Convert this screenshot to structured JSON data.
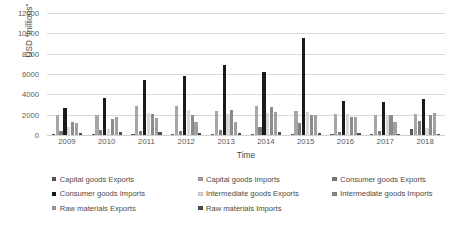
{
  "chart_data": {
    "type": "bar",
    "title": "",
    "xlabel": "Time",
    "ylabel": "USD \"millions\"",
    "categories": [
      "2009",
      "2010",
      "2011",
      "2012",
      "2013",
      "2014",
      "2015",
      "2016",
      "2017",
      "2018"
    ],
    "ylim": [
      0,
      12000
    ],
    "yticks": [
      0,
      2000,
      4000,
      6000,
      8000,
      10000,
      12000
    ],
    "ytick_labels": [
      "0",
      "2000",
      "4000",
      "6000",
      "8000",
      "10000",
      "12000"
    ],
    "grid": true,
    "legend_position": "bottom",
    "series": [
      {
        "name": "Capital goods Exports",
        "color": "#595959",
        "values": [
          90,
          80,
          90,
          110,
          130,
          110,
          70,
          60,
          90,
          620
        ]
      },
      {
        "name": "Capital goods Imports",
        "color": "#a6a6a6",
        "values": [
          2000,
          1980,
          2880,
          2840,
          2340,
          2840,
          2350,
          2060,
          1930,
          2100
        ]
      },
      {
        "name": "Consumer goods Exports",
        "color": "#7f7f7f",
        "values": [
          380,
          540,
          430,
          390,
          480,
          760,
          1140,
          280,
          360,
          1420
        ]
      },
      {
        "name": "Consumer goods Imports",
        "color": "#1a1a1a",
        "values": [
          2680,
          3670,
          5400,
          5850,
          6930,
          6160,
          9500,
          3300,
          3230,
          3500
        ]
      },
      {
        "name": "Intermediate goods Exports",
        "color": "#d9d9d9",
        "values": [
          820,
          560,
          2120,
          2470,
          2060,
          2180,
          2270,
          2020,
          1980,
          700
        ]
      },
      {
        "name": "Intermediate goods Imports",
        "color": "#8c8c8c",
        "values": [
          1260,
          1570,
          2080,
          1950,
          2460,
          2780,
          2000,
          1750,
          1940,
          1960
        ]
      },
      {
        "name": "Raw materials Exports",
        "color": "#a0a0a0",
        "values": [
          1200,
          1780,
          1690,
          1290,
          1300,
          2240,
          1960,
          1820,
          1320,
          2200
        ]
      },
      {
        "name": "Raw materials Imports",
        "color": "#4d4d4d",
        "values": [
          150,
          260,
          330,
          240,
          200,
          290,
          160,
          170,
          120,
          120
        ]
      }
    ]
  }
}
